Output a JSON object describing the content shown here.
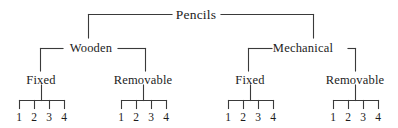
{
  "diagram": {
    "type": "hierarchical-tree",
    "title": "Pencils",
    "line_color": "#3a3a3a",
    "text_color": "#1c1c1c",
    "background_color": "#ffffff",
    "levels": 4,
    "root": {
      "label": "Pencils",
      "x": 196,
      "y": 11
    },
    "level_two": [
      {
        "label": "Wooden",
        "x": 91,
        "y": 45
      },
      {
        "label": "Mechanical",
        "x": 303,
        "y": 45
      }
    ],
    "level_three": [
      {
        "label": "Fixed",
        "x": 41,
        "y": 79,
        "parent": "Wooden"
      },
      {
        "label": "Removable",
        "x": 143,
        "y": 79,
        "parent": "Wooden"
      },
      {
        "label": "Fixed",
        "x": 250,
        "y": 79,
        "parent": "Mechanical"
      },
      {
        "label": "Removable",
        "x": 355,
        "y": 79,
        "parent": "Mechanical"
      }
    ],
    "leaf_groups": [
      {
        "parent": "Fixed",
        "parent_branch": "Wooden",
        "center_x": 41,
        "numbers": [
          {
            "label": "1",
            "x": 19
          },
          {
            "label": "2",
            "x": 34
          },
          {
            "label": "3",
            "x": 49
          },
          {
            "label": "4",
            "x": 64
          }
        ]
      },
      {
        "parent": "Removable",
        "parent_branch": "Wooden",
        "center_x": 143,
        "numbers": [
          {
            "label": "1",
            "x": 121
          },
          {
            "label": "2",
            "x": 136
          },
          {
            "label": "3",
            "x": 151
          },
          {
            "label": "4",
            "x": 166
          }
        ]
      },
      {
        "parent": "Fixed",
        "parent_branch": "Mechanical",
        "center_x": 250,
        "numbers": [
          {
            "label": "1",
            "x": 228
          },
          {
            "label": "2",
            "x": 243
          },
          {
            "label": "3",
            "x": 258
          },
          {
            "label": "4",
            "x": 273
          }
        ]
      },
      {
        "parent": "Removable",
        "parent_branch": "Mechanical",
        "center_x": 355,
        "numbers": [
          {
            "label": "1",
            "x": 333
          },
          {
            "label": "2",
            "x": 348
          },
          {
            "label": "3",
            "x": 363
          },
          {
            "label": "4",
            "x": 378
          }
        ]
      }
    ]
  }
}
